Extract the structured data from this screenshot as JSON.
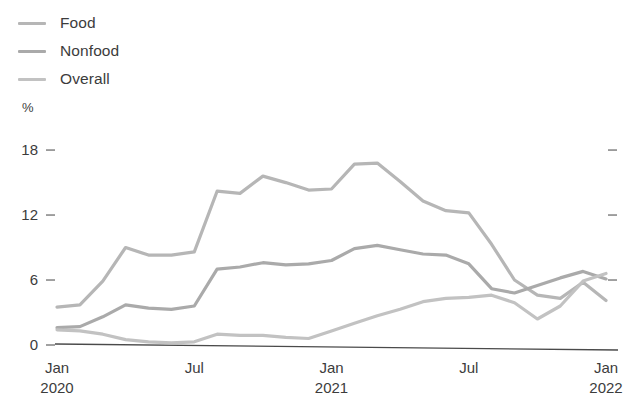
{
  "legend": {
    "position": "top-left",
    "items": [
      {
        "label": "Food",
        "color": "#b6b6b6",
        "icon": "line-swatch-icon"
      },
      {
        "label": "Nonfood",
        "color": "#aaaaaa",
        "icon": "line-swatch-icon"
      },
      {
        "label": "Overall",
        "color": "#c2c2c2",
        "icon": "line-swatch-icon"
      }
    ]
  },
  "axis": {
    "unit_label": "%",
    "y_ticks": [
      "18",
      "12",
      "6",
      "0"
    ],
    "x_ticks": [
      {
        "month": "Jan",
        "year": "2020"
      },
      {
        "month": "Jul",
        "year": ""
      },
      {
        "month": "Jan",
        "year": "2021"
      },
      {
        "month": "Jul",
        "year": ""
      },
      {
        "month": "Jan",
        "year": "2022"
      }
    ]
  },
  "colors": {
    "axis_line": "#4a4a4a",
    "tick": "#8a8a8a",
    "text": "#3c3c3c",
    "food": "#b6b6b6",
    "nonfood": "#aaaaaa",
    "overall": "#c2c2c2"
  },
  "chart_data": {
    "type": "line",
    "title": "",
    "xlabel": "",
    "ylabel": "%",
    "ylim": [
      0,
      19.5
    ],
    "grid": false,
    "legend_position": "top-left",
    "x": [
      "Jan 2020",
      "Feb 2020",
      "Mar 2020",
      "Apr 2020",
      "May 2020",
      "Jun 2020",
      "Jul 2020",
      "Aug 2020",
      "Sep 2020",
      "Oct 2020",
      "Nov 2020",
      "Dec 2020",
      "Jan 2021",
      "Feb 2021",
      "Mar 2021",
      "Apr 2021",
      "May 2021",
      "Jun 2021",
      "Jul 2021",
      "Aug 2021",
      "Sep 2021",
      "Oct 2021",
      "Nov 2021",
      "Dec 2021",
      "Jan 2022"
    ],
    "series": [
      {
        "name": "Food",
        "color": "#b6b6b6",
        "values": [
          3.5,
          3.7,
          5.9,
          9.0,
          8.3,
          8.3,
          8.6,
          14.2,
          14.0,
          15.6,
          15.0,
          14.3,
          14.4,
          16.7,
          16.8,
          15.1,
          13.3,
          12.4,
          12.2,
          9.3,
          6.0,
          4.6,
          4.3,
          5.8,
          4.1
        ]
      },
      {
        "name": "Nonfood",
        "color": "#aaaaaa",
        "values": [
          1.6,
          1.7,
          2.6,
          3.7,
          3.4,
          3.3,
          3.6,
          7.0,
          7.2,
          7.6,
          7.4,
          7.5,
          7.8,
          8.9,
          9.2,
          8.8,
          8.4,
          8.3,
          7.5,
          5.2,
          4.8,
          5.5,
          6.2,
          6.8,
          6.1
        ]
      },
      {
        "name": "Overall",
        "color": "#c2c2c2",
        "values": [
          1.4,
          1.3,
          1.0,
          0.5,
          0.3,
          0.2,
          0.3,
          1.0,
          0.9,
          0.9,
          0.7,
          0.6,
          1.3,
          2.0,
          2.7,
          3.3,
          4.0,
          4.3,
          4.4,
          4.6,
          3.9,
          2.4,
          3.6,
          5.9,
          6.6
        ]
      }
    ]
  },
  "plot_geometry": {
    "x_start": 57,
    "x_end": 606,
    "y_zero": 345,
    "y_per_unit": 10.83
  }
}
